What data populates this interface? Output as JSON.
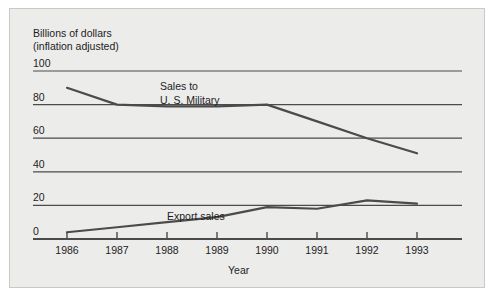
{
  "chart_data": {
    "type": "line",
    "title": "",
    "ylabel_line1": "Billions of dollars",
    "ylabel_line2": "(inflation adjusted)",
    "xlabel": "Year",
    "categories": [
      "1986",
      "1987",
      "1988",
      "1989",
      "1990",
      "1991",
      "1992",
      "1993"
    ],
    "x": [
      1986,
      1987,
      1988,
      1989,
      1990,
      1991,
      1992,
      1993
    ],
    "ylim": [
      0,
      100
    ],
    "yticks": [
      "0",
      "20",
      "40",
      "60",
      "80",
      "100"
    ],
    "ytick_values": [
      0,
      20,
      40,
      60,
      80,
      100
    ],
    "grid": true,
    "legend_position": "inline-annotations",
    "series": [
      {
        "name": "Sales to U. S. Military",
        "label_line1": "Sales to",
        "label_line2": "U. S. Military",
        "values": [
          90,
          80,
          79,
          79,
          80,
          70,
          60,
          51
        ],
        "color": "#4b4b4b"
      },
      {
        "name": "Export sales",
        "label_line1": "Export sales",
        "label_line2": "",
        "values": [
          4,
          7,
          10,
          13,
          19,
          18,
          23,
          21
        ],
        "color": "#4b4b4b"
      }
    ],
    "annotations": [
      {
        "text": "Sales to",
        "series": "Sales to U. S. Military"
      },
      {
        "text": "U. S. Military",
        "series": "Sales to U. S. Military"
      },
      {
        "text": "Export sales",
        "series": "Export sales"
      }
    ],
    "colors": {
      "background": "#ececeb",
      "line": "#4b4b4b",
      "gridline": "#4b4b4b",
      "axis": "#1d1d1d",
      "text": "#1d1d1d"
    }
  }
}
